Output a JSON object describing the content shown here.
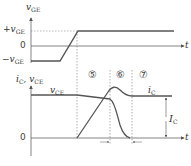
{
  "diagram": {
    "upper_plot": {
      "y_axis_label_main": "v",
      "y_axis_label_sub": "GE",
      "levels": {
        "positive_prefix": "+",
        "positive_main": "v",
        "positive_sub": "GE",
        "zero": "0",
        "negative_prefix": "−",
        "negative_main": "v",
        "negative_sub": "GE"
      },
      "x_axis_label": "t"
    },
    "lower_plot": {
      "y_axis_label_1_main": "i",
      "y_axis_label_1_sub": "C",
      "y_axis_sep": ", ",
      "y_axis_label_2_main": "v",
      "y_axis_label_2_sub": "CE",
      "zero": "0",
      "x_axis_label": "t",
      "vce_curve_label_main": "v",
      "vce_curve_label_sub": "CE",
      "ic_curve_label_main": "i",
      "ic_curve_label_sub": "C",
      "ic_steady_label_main": "I",
      "ic_steady_label_sub": "C"
    },
    "intervals": [
      "⑤",
      "⑥",
      "⑦"
    ],
    "colors": {
      "waveform": "#555555",
      "axis": "#666666",
      "dashed": "#777777",
      "text": "#333333"
    }
  }
}
